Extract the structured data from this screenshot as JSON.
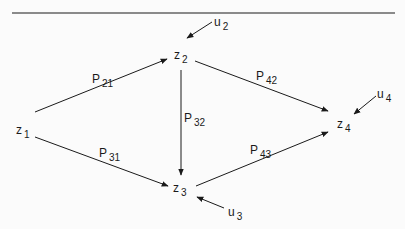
{
  "diagram": {
    "type": "path-diagram",
    "colors": {
      "ink": "#1a1a1a",
      "background": "#fbfbfb"
    },
    "nodes": [
      {
        "id": "z1",
        "base": "z",
        "sub": "1"
      },
      {
        "id": "z2",
        "base": "z",
        "sub": "2"
      },
      {
        "id": "z3",
        "base": "z",
        "sub": "3"
      },
      {
        "id": "z4",
        "base": "z",
        "sub": "4"
      }
    ],
    "disturbances": [
      {
        "id": "u2",
        "base": "u",
        "sub": "2",
        "target": "z2"
      },
      {
        "id": "u3",
        "base": "u",
        "sub": "3",
        "target": "z3"
      },
      {
        "id": "u4",
        "base": "u",
        "sub": "4",
        "target": "z4"
      }
    ],
    "edges": [
      {
        "from": "z1",
        "to": "z2",
        "base": "P",
        "sub": "21"
      },
      {
        "from": "z1",
        "to": "z3",
        "base": "P",
        "sub": "31"
      },
      {
        "from": "z2",
        "to": "z3",
        "base": "P",
        "sub": "32"
      },
      {
        "from": "z2",
        "to": "z4",
        "base": "P",
        "sub": "42"
      },
      {
        "from": "z3",
        "to": "z4",
        "base": "P",
        "sub": "43"
      }
    ]
  }
}
